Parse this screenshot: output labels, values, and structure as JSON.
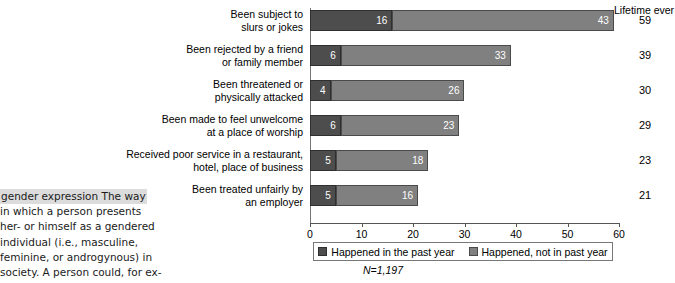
{
  "chart_data": {
    "type": "bar",
    "orientation": "horizontal",
    "stacked": true,
    "title": "",
    "xlabel": "",
    "ylabel": "",
    "xlim": [
      0,
      60
    ],
    "xticks": [
      0,
      10,
      20,
      30,
      40,
      50,
      60
    ],
    "grid": false,
    "legend_position": "bottom",
    "categories": [
      "Been subject to slurs or jokes",
      "Been rejected by a friend or family member",
      "Been threatened or physically attacked",
      "Been made to feel unwelcome at a place of worship",
      "Received poor service in a restaurant, hotel, place of business",
      "Been treated unfairly by an employer"
    ],
    "category_lines": [
      [
        "Been subject to",
        "slurs or jokes"
      ],
      [
        "Been rejected by a friend",
        "or family member"
      ],
      [
        "Been threatened or",
        "physically attacked"
      ],
      [
        "Been made to feel unwelcome",
        "at a place of worship"
      ],
      [
        "Received poor service in a restaurant,",
        "hotel, place of business"
      ],
      [
        "Been treated unfairly by",
        "an employer"
      ]
    ],
    "series": [
      {
        "name": "Happened in the past year",
        "color": "#4d4d4d",
        "values": [
          16,
          6,
          4,
          6,
          5,
          5
        ]
      },
      {
        "name": "Happened, not in past year",
        "color": "#808080",
        "values": [
          43,
          33,
          26,
          23,
          18,
          16
        ]
      }
    ],
    "lifetime_header": "Lifetime ever",
    "lifetime_values": [
      59,
      39,
      30,
      29,
      23,
      21
    ],
    "footnote": "N=1,197"
  },
  "legend": {
    "items": [
      {
        "label": "Happened in the past year",
        "swatch": "past"
      },
      {
        "label": "Happened, not in past year",
        "swatch": "notpast"
      }
    ]
  },
  "glossary": {
    "term": "gender expression",
    "lines": [
      "gender expression  The way",
      "in which a person presents",
      "her- or himself as a gendered",
      "individual (i.e., masculine,",
      "feminine, or androgynous) in",
      "society. A person could, for ex-"
    ]
  }
}
